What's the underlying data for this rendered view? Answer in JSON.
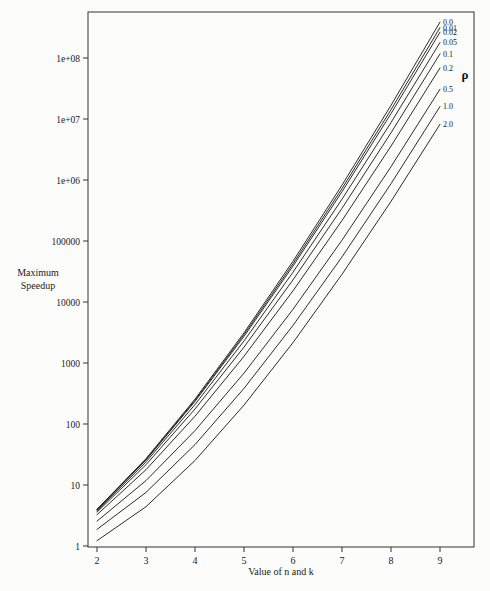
{
  "figure": {
    "background": "#fcfcfa",
    "line_color": "#141414",
    "axis_color": "#333333"
  },
  "chart_data": {
    "type": "line",
    "title": "",
    "xlabel": "Value of n and k",
    "ylabel": "Maximum Speedup",
    "ylabel_lines": [
      "Maximum",
      "Speedup"
    ],
    "legend_label": "ρ",
    "legend_position": "right-inside",
    "grid": false,
    "x": [
      2,
      3,
      4,
      5,
      6,
      7,
      8,
      9
    ],
    "x_tick_labels": [
      "2",
      "3",
      "4",
      "5",
      "6",
      "7",
      "8",
      "9"
    ],
    "y_scale": "log",
    "xlim": [
      1.82,
      9.7
    ],
    "ylim": [
      1,
      560000000
    ],
    "y_ticks": [
      {
        "label": "1",
        "value": 1
      },
      {
        "label": "10",
        "value": 10
      },
      {
        "label": "100",
        "value": 100
      },
      {
        "label": "1000",
        "value": 1000
      },
      {
        "label": "10000",
        "value": 10000
      },
      {
        "label": "100000",
        "value": 100000
      },
      {
        "label": "1e+06",
        "value": 1000000
      },
      {
        "label": "1e+07",
        "value": 10000000
      },
      {
        "label": "1e+08",
        "value": 100000000
      }
    ],
    "series": [
      {
        "name": "rho-0.0",
        "label": "0.0",
        "values": [
          4.0,
          27,
          256,
          3125,
          46656,
          823543,
          16777216,
          387420489
        ]
      },
      {
        "name": "rho-0.01",
        "label": "0.01",
        "values": [
          3.95,
          26.3,
          245,
          2917,
          42300,
          722400,
          14180000,
          314600000
        ]
      },
      {
        "name": "rho-0.02",
        "label": "0.02",
        "values": [
          3.91,
          25.7,
          235,
          2734,
          38700,
          643400,
          12280000,
          264800000
        ]
      },
      {
        "name": "rho-0.05",
        "label": "0.05",
        "values": [
          3.78,
          23.9,
          208,
          2303,
          30800,
          484400,
          8764000,
          179600000
        ]
      },
      {
        "name": "rho-0.1",
        "label": "0.1",
        "values": [
          3.59,
          21.5,
          176,
          1823,
          23000,
          343100,
          5931000,
          116900000
        ]
      },
      {
        "name": "rho-0.2",
        "label": "0.2",
        "values": [
          3.26,
          17.8,
          134,
          1287,
          15260,
          216700,
          3602000,
          68830000
        ]
      },
      {
        "name": "rho-0.5",
        "label": "0.5",
        "values": [
          2.55,
          11.8,
          78,
          684,
          7595,
          102900,
          1654000,
          30820000
        ]
      },
      {
        "name": "rho-1.0",
        "label": "1.0",
        "values": [
          1.87,
          7.56,
          46,
          384,
          4134,
          54900,
          869900,
          16050000
        ]
      },
      {
        "name": "rho-2.0",
        "label": "2.0",
        "values": [
          1.22,
          4.4,
          25.2,
          204,
          2163,
          28400,
          446500,
          8193000
        ]
      }
    ]
  }
}
